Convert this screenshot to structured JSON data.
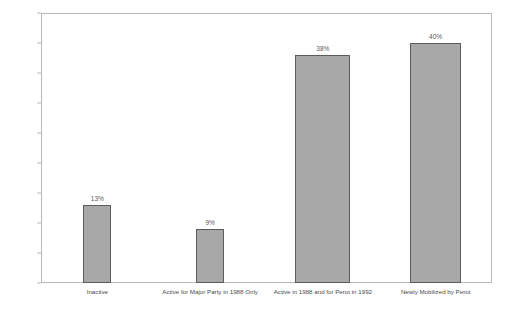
{
  "chart_data": {
    "type": "bar",
    "title": "",
    "xlabel": "",
    "ylabel": "",
    "ylim": [
      0,
      45
    ],
    "grid": false,
    "legend": "none",
    "y_ticks": [
      "0%",
      "5%",
      "10%",
      "15%",
      "20%",
      "25%",
      "30%",
      "35%",
      "40%",
      "45%"
    ],
    "y_tick_values": [
      0,
      5,
      10,
      15,
      20,
      25,
      30,
      35,
      40,
      45
    ],
    "categories": [
      "Inactive",
      "Active for Major Party in 1988 Only",
      "Active in 1988 and for Perot in 1992",
      "Newly Mobilized by Perot"
    ],
    "values": [
      13,
      9,
      38,
      40
    ],
    "data_labels": [
      "13%",
      "9%",
      "38%",
      "40%"
    ],
    "bar_color": "#a8a8a8",
    "bar_border_color": "#5c5c5c",
    "axis_color": "#b9b9b9"
  }
}
